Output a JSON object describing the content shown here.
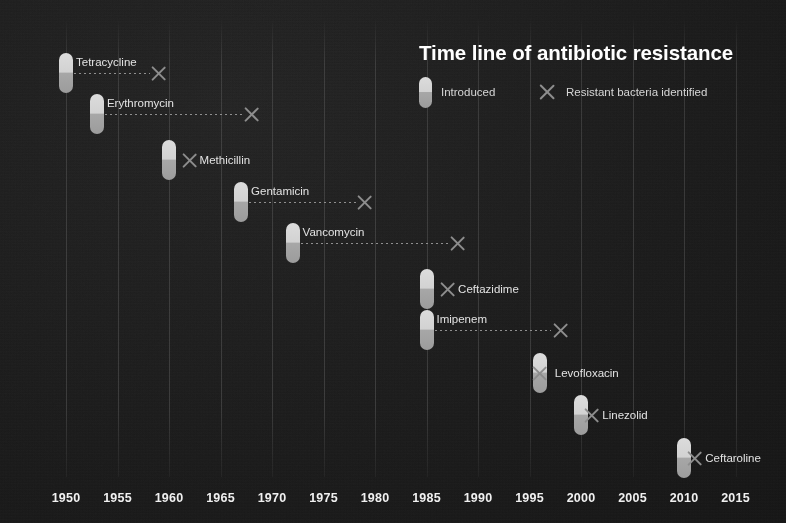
{
  "chart_data": {
    "type": "timeline",
    "title": "Time line of antibiotic resistance",
    "xlabel": "",
    "ylabel": "",
    "xlim": [
      1948,
      2017
    ],
    "grid": true,
    "legend": {
      "position": "top-right",
      "entries": [
        {
          "marker": "pill",
          "label": "Introduced"
        },
        {
          "marker": "x",
          "label": "Resistant bacteria identified"
        }
      ]
    },
    "xticks": [
      1950,
      1955,
      1960,
      1965,
      1970,
      1975,
      1980,
      1985,
      1990,
      1995,
      2000,
      2005,
      2010,
      2015
    ],
    "categories": [
      "Tetracycline",
      "Erythromycin",
      "Methicillin",
      "Gentamicin",
      "Vancomycin",
      "Ceftazidime",
      "Imipenem",
      "Levofloxacin",
      "Linezolid",
      "Ceftaroline"
    ],
    "series": [
      {
        "name": "Introduced",
        "values": [
          1950,
          1953,
          1960,
          1967,
          1972,
          1985,
          1985,
          1996,
          2000,
          2010
        ]
      },
      {
        "name": "Resistant bacteria identified",
        "values": [
          1959,
          1968,
          1962,
          1979,
          1988,
          1987,
          1998,
          1996,
          2001,
          2011
        ]
      }
    ],
    "rows": [
      {
        "label": "Tetracycline",
        "introduced": 1950,
        "resistant": 1959,
        "y": 73,
        "label_side": "right",
        "label_offset": 10
      },
      {
        "label": "Erythromycin",
        "introduced": 1953,
        "resistant": 1968,
        "y": 114,
        "label_side": "right",
        "label_offset": 10
      },
      {
        "label": "Methicillin",
        "introduced": 1960,
        "resistant": 1962,
        "y": 160,
        "label_side": "after-x",
        "label_offset": 10
      },
      {
        "label": "Gentamicin",
        "introduced": 1967,
        "resistant": 1979,
        "y": 202,
        "label_side": "right",
        "label_offset": 10
      },
      {
        "label": "Vancomycin",
        "introduced": 1972,
        "resistant": 1988,
        "y": 243,
        "label_side": "right",
        "label_offset": 10
      },
      {
        "label": "Ceftazidime",
        "introduced": 1985,
        "resistant": 1987,
        "y": 289,
        "label_side": "after-x",
        "label_offset": 11
      },
      {
        "label": "Imipenem",
        "introduced": 1985,
        "resistant": 1998,
        "y": 330,
        "label_side": "right",
        "label_offset": 10
      },
      {
        "label": "Levofloxacin",
        "introduced": 1996,
        "resistant": 1996,
        "y": 373,
        "label_side": "after-x",
        "label_offset": 11
      },
      {
        "label": "Linezolid",
        "introduced": 2000,
        "resistant": 2001,
        "y": 415,
        "label_side": "after-x",
        "label_offset": 11
      },
      {
        "label": "Ceftaroline",
        "introduced": 2010,
        "resistant": 2011,
        "y": 458,
        "label_side": "after-x",
        "label_offset": 11
      }
    ]
  },
  "colors": {
    "background": "#1b1b1b",
    "pill_top": "#dcdcdc",
    "pill_bottom": "#9c9c9c",
    "x_marker": "#8d8d8d",
    "text": "#e2e2e2",
    "title": "#ffffff",
    "gridline": "#3a3a3a"
  }
}
